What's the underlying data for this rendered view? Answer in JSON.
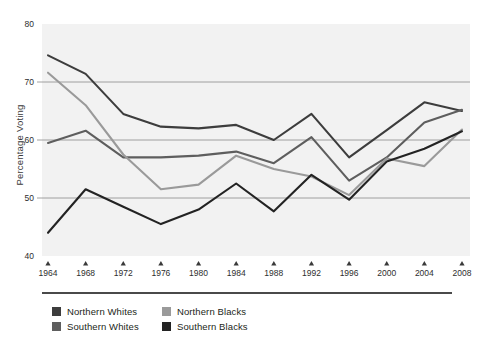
{
  "chart_data": {
    "type": "line",
    "title": "",
    "subtitle": "",
    "xlabel": "",
    "ylabel": "Percentage Voting",
    "categories": [
      "1964",
      "1968",
      "1972",
      "1976",
      "1980",
      "1984",
      "1988",
      "1992",
      "1996",
      "2000",
      "2004",
      "2008"
    ],
    "x": [
      1964,
      1968,
      1972,
      1976,
      1980,
      1984,
      1988,
      1992,
      1996,
      2000,
      2004,
      2008
    ],
    "xlim": [
      1964,
      2008
    ],
    "ylim": [
      40,
      80
    ],
    "yticks": [
      40,
      50,
      60,
      70,
      80
    ],
    "ytick_labels": [
      "40",
      "50",
      "60",
      "70",
      "80"
    ],
    "grid": "horizontal",
    "legend_position": "below-plot",
    "plot_background": "#f2f2f2",
    "gridline_color": "#8c8c8c",
    "series": [
      {
        "name": "Northern Whites",
        "color": "#3d3d3d",
        "values": [
          74.6,
          71.4,
          64.5,
          62.3,
          62.0,
          62.6,
          60.0,
          64.5,
          57.0,
          61.7,
          66.5,
          65.0
        ]
      },
      {
        "name": "Southern Whites",
        "color": "#5e5e5e",
        "values": [
          59.5,
          61.6,
          57.0,
          57.0,
          57.3,
          58.0,
          56.0,
          60.5,
          53.0,
          57.0,
          63.0,
          65.2
        ]
      },
      {
        "name": "Northern Blacks",
        "color": "#9a9a9a",
        "values": [
          71.6,
          66.0,
          57.5,
          51.5,
          52.3,
          57.3,
          55.0,
          53.7,
          50.5,
          56.8,
          55.5,
          61.8
        ]
      },
      {
        "name": "Southern Blacks",
        "color": "#232323",
        "values": [
          44.0,
          51.5,
          48.5,
          45.5,
          48.0,
          52.5,
          47.7,
          54.0,
          49.7,
          56.3,
          58.5,
          61.5
        ]
      }
    ]
  },
  "axis": {
    "y_label": "Percentage Voting",
    "y_ticks": [
      "80",
      "70",
      "60",
      "50",
      "40"
    ],
    "x_ticks": [
      "1964",
      "1968",
      "1972",
      "1976",
      "1980",
      "1984",
      "1988",
      "1992",
      "1996",
      "2000",
      "2004",
      "2008"
    ]
  },
  "legend": {
    "items": [
      {
        "label": "Northern Whites",
        "color": "#3d3d3d"
      },
      {
        "label": "Northern Blacks",
        "color": "#9a9a9a"
      },
      {
        "label": "Southern Whites",
        "color": "#5e5e5e"
      },
      {
        "label": "Southern Blacks",
        "color": "#232323"
      }
    ]
  }
}
